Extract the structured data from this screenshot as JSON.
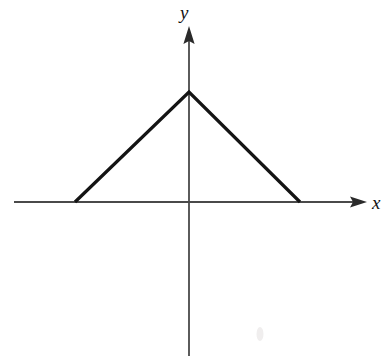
{
  "figure": {
    "name": "triangular-waveform-graph",
    "width": 387,
    "height": 356,
    "background_color": "#ffffff"
  },
  "axes": {
    "x_label": "x",
    "y_label": "y",
    "axis_color": "#4a4a4a",
    "axis_stroke_width": 1.8,
    "x_axis": {
      "y_pixel": 202,
      "start_x": 14,
      "end_x": 367,
      "arrow": "right-arrowhead"
    },
    "y_axis": {
      "x_pixel": 189,
      "start_y": 356,
      "end_y": 26,
      "arrow": "up-arrowhead"
    },
    "origin": {
      "x": 189,
      "y": 202
    },
    "ticks": [],
    "tick_labels": [],
    "grid": false
  },
  "chart_data": {
    "type": "line",
    "title": "",
    "subtitle": "",
    "xlabel": "x",
    "ylabel": "y",
    "grid": false,
    "legend": null,
    "legend_position": "none",
    "annotations": [],
    "curve_color": "#141414",
    "curve_stroke_width": 3.2,
    "x": [
      -1,
      0,
      1
    ],
    "y": [
      0,
      1,
      0
    ],
    "series": [
      {
        "name": "triangular pulse",
        "points_pixel": [
          {
            "x": 75,
            "y": 202
          },
          {
            "x": 189,
            "y": 92
          },
          {
            "x": 300,
            "y": 202
          }
        ],
        "values": [
          0,
          1,
          0
        ]
      }
    ],
    "xlim": [
      -1.54,
      1.56
    ],
    "ylim": [
      -1.4,
      1.6
    ]
  },
  "artifacts": {
    "scan_speck": {
      "x": 260,
      "y": 334,
      "color": "#f0eeee"
    }
  }
}
